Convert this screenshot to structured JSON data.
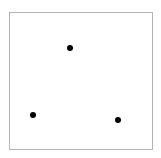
{
  "diagram": {
    "frame": {
      "x": 9,
      "y": 12,
      "width": 144,
      "height": 138,
      "border_color": "#b4b4b4",
      "background": "#ffffff"
    },
    "dots": [
      {
        "id": "top",
        "cx": 70,
        "cy": 48,
        "diameter": 6,
        "color": "#000000"
      },
      {
        "id": "bottom-left",
        "cx": 33,
        "cy": 115,
        "diameter": 6,
        "color": "#000000"
      },
      {
        "id": "bottom-right",
        "cx": 118,
        "cy": 120,
        "diameter": 6,
        "color": "#000000"
      }
    ]
  }
}
